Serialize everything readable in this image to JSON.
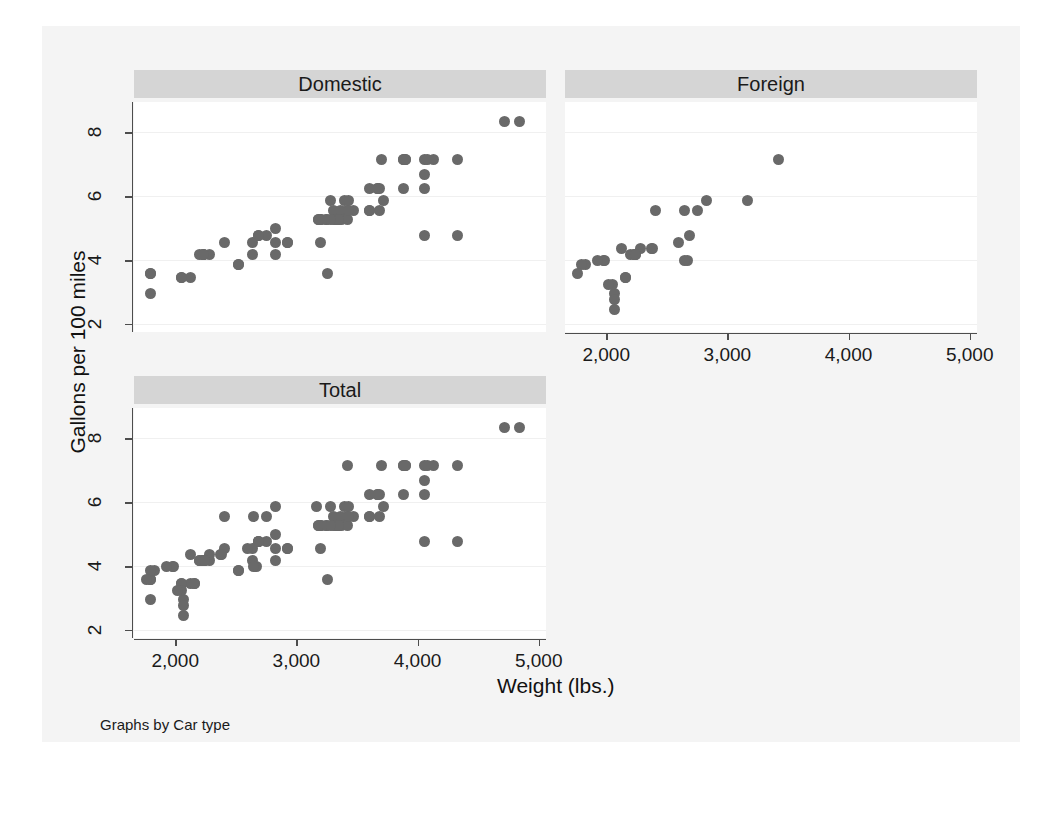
{
  "figure": {
    "note": "Graphs by Car type",
    "axis_titles": {
      "x": "Weight (lbs.)",
      "y": "Gallons per 100 miles"
    },
    "panels": [
      {
        "key": "domestic",
        "title": "Domestic"
      },
      {
        "key": "foreign",
        "title": "Foreign"
      },
      {
        "key": "total",
        "title": "Total"
      }
    ],
    "xticks": [
      "2,000",
      "3,000",
      "4,000",
      "5,000"
    ],
    "yticks": [
      "2",
      "4",
      "6",
      "8"
    ],
    "colors": {
      "marker": "#696969",
      "panel_title_bg": "#d5d5d5",
      "plot_bg": "#ffffff",
      "figure_bg": "#f4f4f4",
      "axis": "#4d4d4d",
      "grid": "#f0f0f0"
    }
  },
  "chart_data": {
    "type": "scatter",
    "title": "",
    "xlabel": "Weight (lbs.)",
    "ylabel": "Gallons per 100 miles",
    "xlim": [
      1660,
      5060
    ],
    "ylim": [
      1.75,
      8.95
    ],
    "xticks": [
      2000,
      3000,
      4000,
      5000
    ],
    "yticks": [
      2,
      4,
      6,
      8
    ],
    "grid": "horizontal",
    "legend": "none",
    "facet_by": "Car type",
    "facets": [
      "Domestic",
      "Foreign",
      "Total"
    ],
    "series": [
      {
        "name": "Domestic",
        "panel": "domestic",
        "x": [
          4720,
          4840,
          3880,
          3900,
          4060,
          4080,
          4130,
          4330,
          3700,
          4060,
          3690,
          3600,
          3670,
          3880,
          4060,
          3720,
          3400,
          3280,
          3310,
          3360,
          3420,
          3310,
          3330,
          3250,
          3200,
          3330,
          3470,
          3600,
          3690,
          3350,
          3370,
          3180,
          3210,
          2930,
          3200,
          2640,
          2690,
          2750,
          2830,
          2640,
          2830,
          2520,
          2410,
          2200,
          2230,
          2230,
          2280,
          1800,
          1800,
          2050,
          2130,
          4060,
          4330,
          3260,
          3430,
          3420,
          3880,
          3900,
          2690,
          3180,
          3330,
          3350,
          3600,
          3670,
          2830,
          2930,
          2520,
          2230,
          2050,
          1800,
          3250,
          3280,
          3430
        ],
        "y": [
          8.33,
          8.33,
          7.14,
          7.14,
          7.14,
          7.14,
          7.14,
          7.14,
          7.14,
          6.67,
          6.25,
          6.25,
          6.25,
          6.25,
          6.25,
          5.88,
          5.88,
          5.88,
          5.56,
          5.56,
          5.56,
          5.26,
          5.26,
          5.26,
          5.26,
          5.26,
          5.56,
          5.56,
          5.56,
          5.26,
          5.26,
          5.26,
          5.26,
          4.55,
          4.55,
          4.55,
          4.76,
          4.76,
          5.0,
          4.17,
          4.17,
          3.85,
          4.55,
          4.17,
          4.17,
          4.17,
          4.17,
          3.57,
          2.94,
          3.45,
          3.45,
          4.76,
          4.76,
          3.57,
          5.88,
          5.26,
          7.14,
          7.14,
          4.76,
          5.26,
          5.26,
          5.26,
          5.56,
          6.25,
          4.55,
          4.55,
          3.85,
          4.17,
          3.45,
          3.57,
          5.26,
          5.26,
          5.56
        ],
        "marker": "circle",
        "color": "#696969"
      },
      {
        "name": "Foreign",
        "panel": "foreign",
        "x": [
          3420,
          3170,
          2830,
          2750,
          2650,
          2600,
          2690,
          2670,
          2410,
          2370,
          2280,
          2240,
          2230,
          2200,
          2160,
          2130,
          2070,
          2050,
          2020,
          1990,
          1980,
          1930,
          1830,
          1800,
          1760,
          2070,
          2070,
          2160,
          2230,
          2240,
          2380,
          2650
        ],
        "y": [
          7.14,
          5.88,
          5.88,
          5.56,
          5.56,
          4.55,
          4.76,
          4.0,
          5.56,
          4.35,
          4.35,
          4.17,
          4.17,
          4.17,
          3.45,
          4.35,
          2.94,
          3.23,
          3.23,
          4.0,
          4.0,
          4.0,
          3.85,
          3.85,
          3.57,
          2.78,
          2.45,
          3.45,
          4.17,
          4.17,
          4.35,
          4.0
        ],
        "marker": "circle",
        "color": "#696969"
      },
      {
        "name": "Total",
        "panel": "total",
        "note": "All observations: Domestic and Foreign combined",
        "marker": "circle",
        "color": "#696969"
      }
    ]
  }
}
